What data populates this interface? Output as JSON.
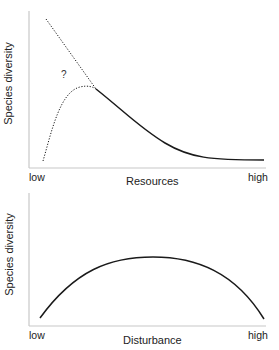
{
  "panels": [
    {
      "id": "resources",
      "y_label": "Species diversity",
      "x_label": "Resources",
      "x_tick_low": "low",
      "x_tick_high": "high",
      "annotation": "?",
      "curves": [
        {
          "name": "decreasing-dotted-extension",
          "style": "dotted",
          "description": "dotted line from high diversity at low resources descending to join solid curve"
        },
        {
          "name": "hump-dotted",
          "style": "dotted",
          "description": "dotted curve rising from low diversity at low resources to a peak then joining solid curve"
        },
        {
          "name": "decline-solid",
          "style": "solid",
          "description": "solid curve declining with increasing resources, leveling off at high"
        }
      ]
    },
    {
      "id": "disturbance",
      "y_label": "Species diversity",
      "x_label": "Disturbance",
      "x_tick_low": "low",
      "x_tick_high": "high",
      "curves": [
        {
          "name": "hump-solid",
          "style": "solid",
          "description": "unimodal curve peaking at intermediate disturbance"
        }
      ]
    }
  ],
  "colors": {
    "axis": "#c8c8c8",
    "curve": "#1a1a1a",
    "text": "#222222"
  }
}
